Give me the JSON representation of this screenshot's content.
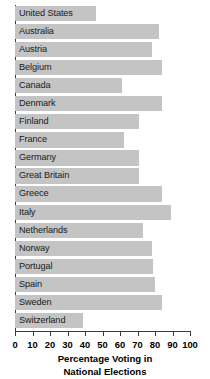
{
  "chart_data": {
    "type": "bar",
    "orientation": "horizontal",
    "title": "",
    "xlabel_lines": [
      "Percentage Voting in",
      "National Elections"
    ],
    "ylabel": "",
    "xlim": [
      0,
      100
    ],
    "xticks": [
      0,
      10,
      20,
      30,
      40,
      50,
      60,
      70,
      80,
      90,
      100
    ],
    "grid": false,
    "legend": null,
    "bar_color": "#c4c4c4",
    "axis_color": "#3a3a3a",
    "categories": [
      "United States",
      "Australia",
      "Austria",
      "Belgium",
      "Canada",
      "Denmark",
      "Finland",
      "France",
      "Germany",
      "Great Britain",
      "Greece",
      "Italy",
      "Netherlands",
      "Norway",
      "Portugal",
      "Spain",
      "Sweden",
      "Switzerland"
    ],
    "values": [
      46,
      82,
      78,
      84,
      61,
      84,
      71,
      62,
      71,
      71,
      84,
      89,
      73,
      78,
      79,
      80,
      84,
      39
    ]
  }
}
